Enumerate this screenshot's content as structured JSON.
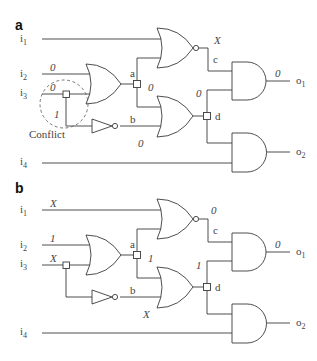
{
  "panels": [
    {
      "id": "a",
      "label": "a",
      "inputs": {
        "i1": "i",
        "i1_sub": "1",
        "i2": "i",
        "i2_sub": "2",
        "i3": "i",
        "i3_sub": "3",
        "i4": "i",
        "i4_sub": "4"
      },
      "outputs": {
        "o1": "o",
        "o1_sub": "1",
        "o2": "o",
        "o2_sub": "2"
      },
      "nodes": {
        "a": "a",
        "b": "b",
        "c": "c",
        "d": "d"
      },
      "values": {
        "i2": "0",
        "i3": "0",
        "i3_branch": "1",
        "a_out": "0",
        "b_out": "0",
        "c_out": "X",
        "d_out": "0",
        "o1": "0"
      },
      "annotation": "Conflict"
    },
    {
      "id": "b",
      "label": "b",
      "inputs": {
        "i1": "i",
        "i1_sub": "1",
        "i2": "i",
        "i2_sub": "2",
        "i3": "i",
        "i3_sub": "3",
        "i4": "i",
        "i4_sub": "4"
      },
      "outputs": {
        "o1": "o",
        "o1_sub": "1",
        "o2": "o",
        "o2_sub": "2"
      },
      "nodes": {
        "a": "a",
        "b": "b",
        "c": "c",
        "d": "d"
      },
      "values": {
        "i1": "X",
        "i2": "1",
        "i3": "X",
        "a_out": "1",
        "b_out": "X",
        "c_out": "0",
        "d_out": "1",
        "o1": "0"
      }
    }
  ],
  "gates": [
    "OR (i2,i3 → a)",
    "NOT (i3 → b)",
    "NOR (i1,a → c)",
    "OR (a,b → d)",
    "AND (c,d → o1)",
    "AND (d,i4 → o2)"
  ]
}
